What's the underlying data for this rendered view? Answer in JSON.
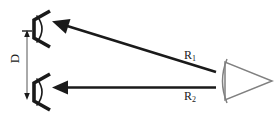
{
  "figure": {
    "type": "radar-two-reflector-range-diagram",
    "background_color": "#ffffff",
    "width": 278,
    "height": 118,
    "stroke_dark": "#1a1a1a",
    "stroke_gray": "#808080"
  },
  "labels": {
    "distance": "D",
    "range_1": "R",
    "range_1_sub": "1",
    "range_2": "R",
    "range_2_sub": "2"
  },
  "elements": {
    "reflector_top_name": "corner-reflector-top",
    "reflector_bottom_name": "corner-reflector-bottom",
    "antenna_name": "radar-antenna",
    "arrow_r1_name": "range-arrow-r1",
    "arrow_r2_name": "range-arrow-r2",
    "dimension_d_name": "dimension-line-d"
  }
}
